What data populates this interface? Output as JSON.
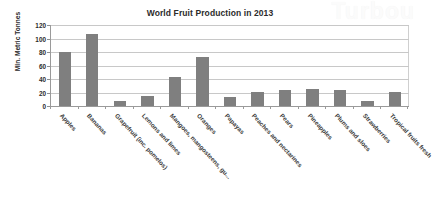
{
  "watermark": {
    "text": "Turbou"
  },
  "chart_data": {
    "type": "bar",
    "title": "World Fruit Production in 2013",
    "xlabel": "",
    "ylabel": "Mln. Metric Tonnes",
    "ylim": [
      0,
      120
    ],
    "yticks": [
      0,
      20,
      40,
      60,
      80,
      100,
      120
    ],
    "grid": true,
    "legend": false,
    "bar_color": "#7f7f7f",
    "categories": [
      "Apples",
      "Bananas",
      "Grapefruit (inc. pomelos)",
      "Lemons and limes",
      "Mangoes, mangosteens, gu...",
      "Oranges",
      "Papayas",
      "Peaches and nectarines",
      "Pears",
      "Pineapples",
      "Plums and sloes",
      "Strawberries",
      "Tropical fruits fresh"
    ],
    "values": [
      80,
      106,
      8,
      15,
      43,
      72,
      13,
      21,
      24,
      25,
      24,
      8,
      21
    ]
  }
}
